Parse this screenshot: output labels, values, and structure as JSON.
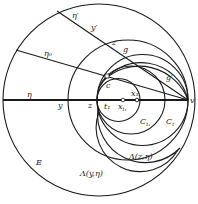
{
  "diagram": {
    "type": "geometric-construction",
    "stroke_color": "#1a1a1a",
    "background": "#ffffff",
    "circles": [
      {
        "name": "E",
        "cx": 99,
        "cy": 100,
        "r": 96
      },
      {
        "name": "Lambda(y,eta)",
        "cx": 128,
        "cy": 100,
        "r": 60
      },
      {
        "name": "Lambda(z,eta)",
        "cx": 142,
        "cy": 100,
        "r": 45
      },
      {
        "name": "C_t",
        "cx": 131,
        "cy": 100,
        "r": 34
      },
      {
        "name": "C_t1",
        "cx": 118.5,
        "cy": 100,
        "r": 21.5
      },
      {
        "name": "upper-arc-1",
        "cx": 142,
        "cy": 100,
        "r": 52
      },
      {
        "name": "upper-arc-2",
        "cx": 148,
        "cy": 100,
        "r": 48
      }
    ],
    "lines": [
      {
        "name": "eta-axis",
        "x1": 3,
        "y1": 100,
        "x2": 188,
        "y2": 100
      },
      {
        "name": "eta-prime-ray",
        "x1": 57,
        "y1": 11,
        "x2": 188,
        "y2": 100
      },
      {
        "name": "eta0-ray",
        "x1": 16,
        "y1": 50,
        "x2": 188,
        "y2": 100
      }
    ],
    "points": [
      {
        "name": "x_t1",
        "x": 123,
        "y": 100,
        "style": "open"
      },
      {
        "name": "x_1",
        "x": 137,
        "y": 100,
        "style": "solid"
      },
      {
        "name": "c",
        "x": 107,
        "y": 76,
        "style": "square"
      }
    ],
    "labels": {
      "eta_prime": "η′",
      "y_prime": "y′",
      "z_prime": "z′",
      "g": "g",
      "eta0": "η₀",
      "c": "c",
      "g_prime": "g′",
      "eta": "η",
      "y": "y",
      "z": "z",
      "t1": "t₁",
      "x_t1": "x",
      "x_t1_sub": "t₁",
      "x1": "x₁",
      "v": "v",
      "C_t1": "C",
      "C_t1_sub": "t₁",
      "C_t": "C",
      "C_t_sub": "t",
      "E": "E",
      "lambda_z": "Λ(z,η)",
      "lambda_y": "Λ(y,η)"
    }
  }
}
